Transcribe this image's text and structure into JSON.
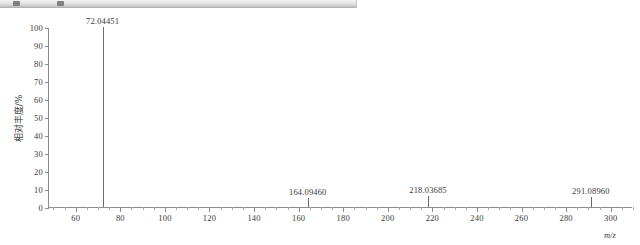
{
  "toolbar": {
    "visible": true,
    "button_1": "toolbar-button",
    "button_2": "toolbar-button"
  },
  "axis": {
    "y_title": "相对丰度/%",
    "x_title": "m/z"
  },
  "chart_data": {
    "type": "bar",
    "title": "",
    "subtitle": "",
    "xlabel": "m/z",
    "ylabel": "相对丰度/%",
    "xlim": [
      48,
      310
    ],
    "ylim": [
      0,
      100
    ],
    "grid": false,
    "legend": null,
    "x_ticks": [
      60,
      80,
      100,
      120,
      140,
      160,
      180,
      200,
      220,
      240,
      260,
      280,
      300
    ],
    "x_tick_labels": [
      "60",
      "80",
      "100",
      "120",
      "140",
      "160",
      "180",
      "200",
      "220",
      "240",
      "260",
      "280",
      "300"
    ],
    "x_minor_step": 5,
    "y_ticks": [
      0,
      10,
      20,
      30,
      40,
      50,
      60,
      70,
      80,
      90,
      100
    ],
    "y_tick_labels": [
      "0",
      "10",
      "20",
      "30",
      "40",
      "50",
      "60",
      "70",
      "80",
      "90",
      "100"
    ],
    "peaks": [
      {
        "mz": 72.04451,
        "label": "72.04451",
        "intensity": 100.0
      },
      {
        "mz": 164.0946,
        "label": "164.09460",
        "intensity": 5.0
      },
      {
        "mz": 218.03685,
        "label": "218.03685",
        "intensity": 6.0
      },
      {
        "mz": 291.0896,
        "label": "291.08960",
        "intensity": 5.5
      }
    ],
    "colors": {
      "peak": "#6b6b6b",
      "axis": "#8c8c8c",
      "text": "#3a3a3a",
      "background": "#ffffff"
    }
  }
}
